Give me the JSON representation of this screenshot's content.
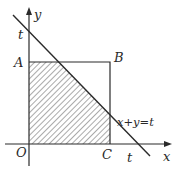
{
  "diagram": {
    "type": "coordinate-geometry",
    "axes": {
      "x_label": "x",
      "y_label": "y",
      "origin_label": "O"
    },
    "points": {
      "A": "A",
      "B": "B",
      "C": "C",
      "O": "O"
    },
    "intercepts": {
      "y_intercept_label": "t",
      "x_intercept_label": "t"
    },
    "line_equation": "x+y=t",
    "colors": {
      "stroke": "#2a2a2a",
      "hatch": "#555555",
      "background": "#ffffff"
    }
  }
}
